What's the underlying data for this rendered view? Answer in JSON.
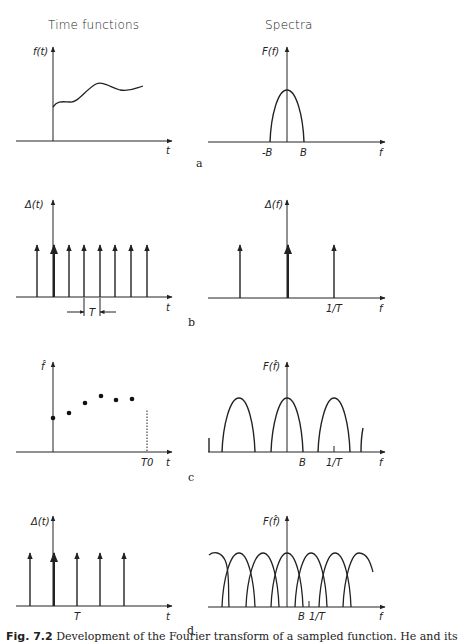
{
  "headers": {
    "left": "Time functions",
    "right": "Spectra"
  },
  "panels": {
    "a": {
      "label": "a",
      "time": {
        "ylabel": "f(t)",
        "xlabel": "t",
        "description": "continuous smooth signal"
      },
      "spectrum": {
        "ylabel": "F(f)",
        "xlabel": "f",
        "ticks": [
          "-B",
          "B"
        ],
        "description": "band-limited spectrum between -B and B"
      }
    },
    "b": {
      "label": "b",
      "time": {
        "ylabel": "Δ(t)",
        "xlabel": "t",
        "spacing_label": "T",
        "impulses": 8
      },
      "spectrum": {
        "ylabel": "Δ(f)",
        "xlabel": "f",
        "ticks": [
          "1/T"
        ],
        "impulses": 3
      }
    },
    "c": {
      "label": "c",
      "time": {
        "ylabel": "f̂",
        "xlabel": "t",
        "ticks": [
          "T0"
        ],
        "samples": 6
      },
      "spectrum": {
        "ylabel": "F(f̂)",
        "xlabel": "f",
        "ticks": [
          "B",
          "1/T"
        ],
        "description": "replicated spectra, non-overlapping"
      }
    },
    "d": {
      "label": "d",
      "time": {
        "ylabel": "Δ(t)",
        "xlabel": "t",
        "ticks": [
          "T"
        ],
        "impulses": 5
      },
      "spectrum": {
        "ylabel": "F(f̂)",
        "xlabel": "f",
        "ticks": [
          "B",
          "1/T"
        ],
        "description": "replicated spectra, overlapping (aliasing)"
      }
    }
  },
  "caption": {
    "prefix": "Fig. 7.2",
    "text": " Development of the Fourier transform of a sampled function. He and its"
  }
}
